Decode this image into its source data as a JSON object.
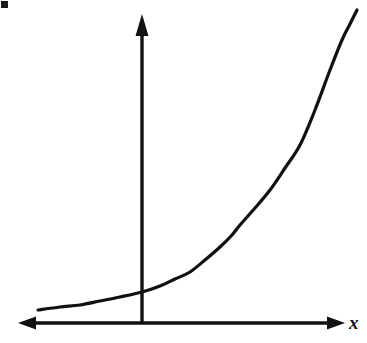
{
  "figure": {
    "background_color": "#ffffff",
    "ink_color": "#111111",
    "width": 367,
    "height": 343
  },
  "labels": {
    "x_axis": "x",
    "y_axis": ""
  },
  "axes": {
    "x_axis_name": "x-axis-line",
    "y_axis_name": "y-axis-line",
    "x_axis_y_px": 323,
    "y_axis_x_px": 142,
    "x_axis_left_px": 18,
    "x_axis_right_px": 345,
    "y_axis_top_px": 14,
    "line_width_px": 3,
    "arrowheads": [
      "x-axis-left-arrowhead",
      "x-axis-right-arrowhead",
      "y-axis-up-arrowhead"
    ]
  },
  "artifacts": {
    "corner_mark": "scan-artifact-top-left"
  },
  "chart_data": {
    "type": "line",
    "title": "",
    "subtitle": "",
    "xlabel": "x",
    "ylabel": "",
    "grid": false,
    "legend": null,
    "axis_style": "arrows-both-ends-on-x-and-up-on-y",
    "origin_px": {
      "x": 142,
      "y": 323
    },
    "xlim_px": [
      18,
      345
    ],
    "ylim_px": [
      14,
      323
    ],
    "series": [
      {
        "name": "exponential-curve",
        "points_px": [
          [
            38,
            310
          ],
          [
            60,
            307
          ],
          [
            80,
            305
          ],
          [
            100,
            301
          ],
          [
            120,
            297
          ],
          [
            142,
            292
          ],
          [
            160,
            286
          ],
          [
            175,
            279
          ],
          [
            190,
            272
          ],
          [
            205,
            260
          ],
          [
            220,
            247
          ],
          [
            232,
            235
          ],
          [
            240,
            225
          ],
          [
            255,
            208
          ],
          [
            270,
            190
          ],
          [
            285,
            168
          ],
          [
            300,
            145
          ],
          [
            315,
            110
          ],
          [
            330,
            70
          ],
          [
            342,
            40
          ],
          [
            350,
            24
          ],
          [
            357,
            10
          ]
        ]
      }
    ]
  }
}
